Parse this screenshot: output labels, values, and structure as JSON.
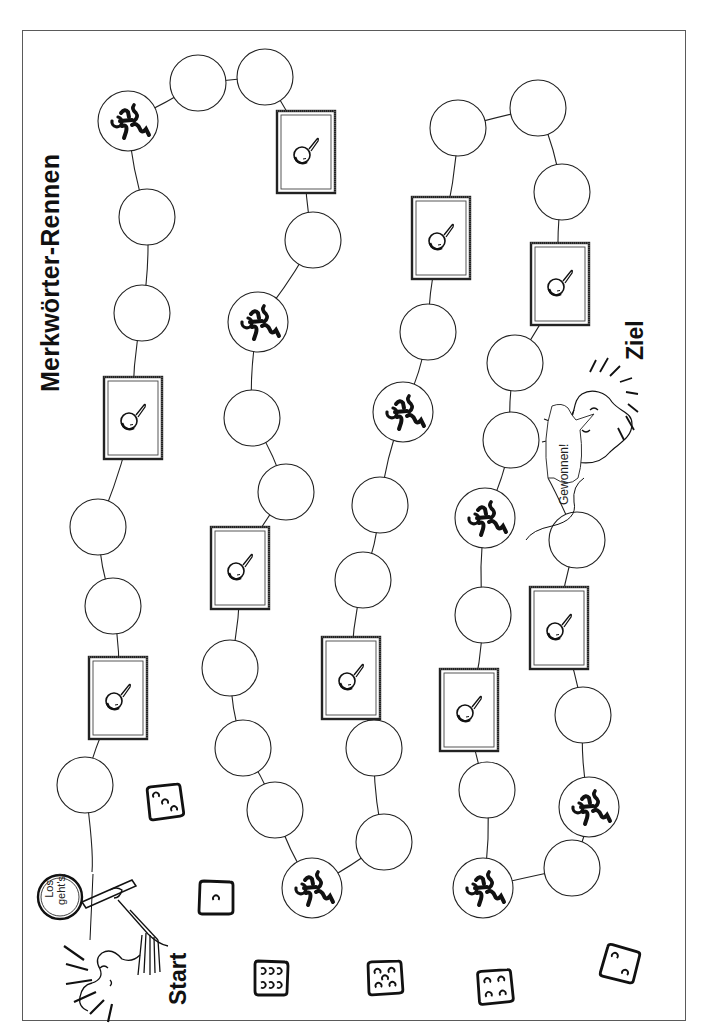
{
  "game": {
    "title": "Merkwörter-Rennen",
    "start_label": "Start",
    "goal_label": "Ziel",
    "start_bubble_line1": "Los",
    "start_bubble_line2": "geht's!",
    "goal_bubble": "Gewonnen!"
  },
  "colors": {
    "ink": "#111111",
    "frame": "#5a5a5a",
    "background": "#ffffff"
  },
  "space_types": {
    "circle": "empty-field",
    "runner": "runner-field",
    "frame": "magnifier-card-field"
  },
  "path": [
    {
      "type": "circle",
      "x": 85,
      "y": 785
    },
    {
      "type": "frame",
      "x": 118,
      "y": 698
    },
    {
      "type": "circle",
      "x": 113,
      "y": 606
    },
    {
      "type": "circle",
      "x": 98,
      "y": 527
    },
    {
      "type": "frame",
      "x": 133,
      "y": 418
    },
    {
      "type": "circle",
      "x": 142,
      "y": 313
    },
    {
      "type": "circle",
      "x": 147,
      "y": 217
    },
    {
      "type": "runner",
      "x": 128,
      "y": 121
    },
    {
      "type": "circle",
      "x": 198,
      "y": 83
    },
    {
      "type": "circle",
      "x": 265,
      "y": 77
    },
    {
      "type": "frame",
      "x": 306,
      "y": 152
    },
    {
      "type": "circle",
      "x": 313,
      "y": 240
    },
    {
      "type": "runner",
      "x": 258,
      "y": 322
    },
    {
      "type": "circle",
      "x": 252,
      "y": 418
    },
    {
      "type": "circle",
      "x": 286,
      "y": 492
    },
    {
      "type": "frame",
      "x": 240,
      "y": 568
    },
    {
      "type": "circle",
      "x": 230,
      "y": 668
    },
    {
      "type": "circle",
      "x": 243,
      "y": 748
    },
    {
      "type": "circle",
      "x": 275,
      "y": 810
    },
    {
      "type": "runner",
      "x": 312,
      "y": 888
    },
    {
      "type": "circle",
      "x": 384,
      "y": 842
    },
    {
      "type": "circle",
      "x": 374,
      "y": 748
    },
    {
      "type": "frame",
      "x": 351,
      "y": 678
    },
    {
      "type": "circle",
      "x": 363,
      "y": 580
    },
    {
      "type": "circle",
      "x": 380,
      "y": 505
    },
    {
      "type": "runner",
      "x": 403,
      "y": 412
    },
    {
      "type": "circle",
      "x": 428,
      "y": 332
    },
    {
      "type": "frame",
      "x": 441,
      "y": 238
    },
    {
      "type": "circle",
      "x": 458,
      "y": 128
    },
    {
      "type": "circle",
      "x": 538,
      "y": 108
    },
    {
      "type": "circle",
      "x": 562,
      "y": 192
    },
    {
      "type": "frame",
      "x": 560,
      "y": 284
    },
    {
      "type": "circle",
      "x": 515,
      "y": 363
    },
    {
      "type": "circle",
      "x": 511,
      "y": 440
    },
    {
      "type": "runner",
      "x": 485,
      "y": 518
    },
    {
      "type": "circle",
      "x": 483,
      "y": 615
    },
    {
      "type": "frame",
      "x": 469,
      "y": 710
    },
    {
      "type": "circle",
      "x": 487,
      "y": 790
    },
    {
      "type": "runner",
      "x": 483,
      "y": 888
    },
    {
      "type": "circle",
      "x": 572,
      "y": 868
    },
    {
      "type": "runner",
      "x": 589,
      "y": 807
    },
    {
      "type": "circle",
      "x": 583,
      "y": 715
    },
    {
      "type": "frame",
      "x": 559,
      "y": 628
    },
    {
      "type": "circle",
      "x": 577,
      "y": 540
    }
  ],
  "dice": [
    {
      "value": 3,
      "x": 165,
      "y": 802,
      "rot": -8
    },
    {
      "value": 1,
      "x": 216,
      "y": 898,
      "rot": 0
    },
    {
      "value": 6,
      "x": 271,
      "y": 978,
      "rot": 0
    },
    {
      "value": 5,
      "x": 385,
      "y": 978,
      "rot": -4
    },
    {
      "value": 4,
      "x": 495,
      "y": 987,
      "rot": -6
    },
    {
      "value": 2,
      "x": 620,
      "y": 964,
      "rot": 14
    }
  ]
}
